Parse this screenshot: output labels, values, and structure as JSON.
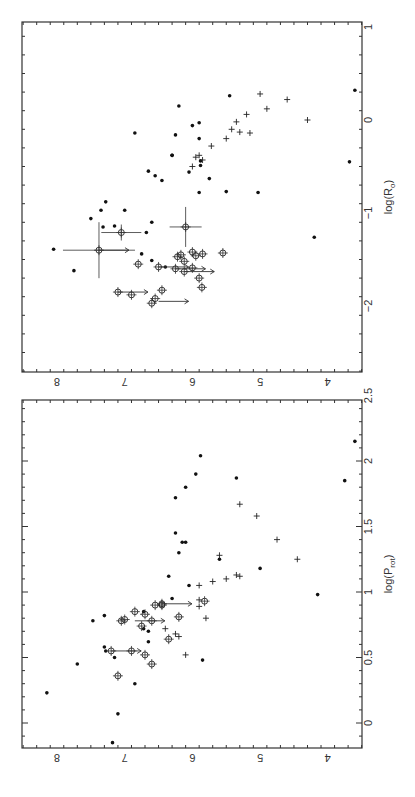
{
  "figure": {
    "rotation_note": "figure rotated 90 degrees; log(Fx) runs horizontally, decreasing left to right",
    "shared_axis_label": "log(F_x)",
    "fx_ticks": [
      "8",
      "7",
      "6",
      "5",
      "4"
    ]
  },
  "chart_data": [
    {
      "type": "scatter",
      "title": "",
      "xlabel": "log(R_o)",
      "ylabel": "log(F_x)",
      "xlim": [
        -2.7,
        1.0
      ],
      "ylim": [
        3.6,
        8.5
      ],
      "x_ticks": [
        "-2",
        "-1",
        "0",
        "1"
      ],
      "y_ticks": [
        "4",
        "5",
        "6",
        "7",
        "8"
      ],
      "grid": false,
      "series": [
        {
          "name": "filled dots",
          "marker": "dot",
          "points": [
            [
              -1.39,
              8.05
            ],
            [
              -1.62,
              7.75
            ],
            [
              -1.06,
              7.5
            ],
            [
              -0.97,
              7.35
            ],
            [
              -0.88,
              7.28
            ],
            [
              -1.14,
              7.15
            ],
            [
              -0.97,
              7.0
            ],
            [
              -1.1,
              6.6
            ],
            [
              -1.44,
              6.75
            ],
            [
              -1.58,
              6.4
            ],
            [
              -1.15,
              7.32
            ],
            [
              -1.21,
              6.68
            ],
            [
              -1.51,
              6.6
            ],
            [
              -0.65,
              6.45
            ],
            [
              -0.56,
              6.05
            ],
            [
              -0.38,
              6.3
            ],
            [
              -0.44,
              5.88
            ],
            [
              -0.14,
              6.85
            ],
            [
              -0.06,
              6.0
            ],
            [
              -0.03,
              5.9
            ],
            [
              -0.49,
              5.88
            ],
            [
              -0.78,
              5.9
            ],
            [
              0.26,
              5.45
            ],
            [
              -0.6,
              6.55
            ],
            [
              -0.63,
              5.75
            ],
            [
              -0.77,
              5.5
            ],
            [
              -0.55,
              6.65
            ],
            [
              -0.16,
              6.25
            ],
            [
              0.15,
              6.2
            ],
            [
              -0.78,
              5.03
            ],
            [
              0.32,
              3.6
            ],
            [
              -0.45,
              3.68
            ],
            [
              -1.26,
              4.2
            ],
            [
              -0.2,
              5.9
            ],
            [
              -0.38,
              6.3
            ]
          ],
          "hint": "approximate"
        },
        {
          "name": "crosses",
          "marker": "plus",
          "points": [
            [
              -0.4,
              5.95
            ],
            [
              -0.5,
              6.0
            ],
            [
              -0.43,
              5.85
            ],
            [
              -0.38,
              5.9
            ],
            [
              -0.2,
              5.5
            ],
            [
              -0.1,
              5.42
            ],
            [
              -0.02,
              5.35
            ],
            [
              -0.14,
              5.15
            ],
            [
              0.06,
              5.2
            ],
            [
              0.28,
              5.0
            ],
            [
              0.12,
              4.9
            ],
            [
              0.22,
              4.6
            ],
            [
              0.0,
              4.3
            ],
            [
              -0.28,
              5.72
            ],
            [
              -0.13,
              5.3
            ]
          ],
          "hint": "approximate"
        },
        {
          "name": "open circles with error bars",
          "marker": "circle",
          "points": [
            [
              -1.4,
              7.38
            ],
            [
              -1.21,
              7.05
            ],
            [
              -1.15,
              6.1
            ],
            [
              -1.42,
              6.0
            ],
            [
              -1.55,
              6.8
            ],
            [
              -1.58,
              6.5
            ],
            [
              -1.6,
              6.25
            ],
            [
              -1.52,
              6.12
            ],
            [
              -1.63,
              6.12
            ],
            [
              -1.85,
              7.1
            ],
            [
              -1.88,
              6.9
            ],
            [
              -1.92,
              6.55
            ],
            [
              -1.83,
              6.45
            ],
            [
              -1.45,
              6.17
            ],
            [
              -1.47,
              6.22
            ],
            [
              -1.59,
              6.0
            ],
            [
              -1.46,
              5.95
            ],
            [
              -1.43,
              5.55
            ],
            [
              -1.44,
              5.85
            ],
            [
              -1.7,
              5.9
            ],
            [
              -1.97,
              6.6
            ],
            [
              -1.8,
              5.86
            ]
          ],
          "hint": "approximate"
        }
      ],
      "annotations": [
        "horizontal arrows indicate upper limits in log(F_x)"
      ]
    },
    {
      "type": "scatter",
      "title": "",
      "xlabel": "log(P_rot)",
      "ylabel": "log(F_x)",
      "xlim": [
        -0.2,
        2.5
      ],
      "ylim": [
        3.6,
        8.5
      ],
      "x_ticks": [
        "0",
        "0.5",
        "1",
        "1.5",
        "2",
        "2.5"
      ],
      "y_ticks": [
        "4",
        "5",
        "6",
        "7",
        "8"
      ],
      "grid": false,
      "series": [
        {
          "name": "filled dots",
          "marker": "dot",
          "points": [
            [
              -0.15,
              7.18
            ],
            [
              0.07,
              7.1
            ],
            [
              0.23,
              8.15
            ],
            [
              0.3,
              6.85
            ],
            [
              0.45,
              7.7
            ],
            [
              0.5,
              7.15
            ],
            [
              0.55,
              7.28
            ],
            [
              0.58,
              7.3
            ],
            [
              0.78,
              7.47
            ],
            [
              0.82,
              7.3
            ],
            [
              0.48,
              5.85
            ],
            [
              0.72,
              6.72
            ],
            [
              0.7,
              6.65
            ],
            [
              0.85,
              6.72
            ],
            [
              0.95,
              6.3
            ],
            [
              1.05,
              6.05
            ],
            [
              1.12,
              6.35
            ],
            [
              1.3,
              6.2
            ],
            [
              1.38,
              6.15
            ],
            [
              1.38,
              6.1
            ],
            [
              1.45,
              6.25
            ],
            [
              1.72,
              6.25
            ],
            [
              1.8,
              6.1
            ],
            [
              1.9,
              5.95
            ],
            [
              2.04,
              5.88
            ],
            [
              1.87,
              5.35
            ],
            [
              1.25,
              5.6
            ],
            [
              1.18,
              5.0
            ],
            [
              0.98,
              4.15
            ],
            [
              1.85,
              3.75
            ],
            [
              2.15,
              3.6
            ],
            [
              0.62,
              6.65
            ]
          ],
          "hint": "approximate"
        },
        {
          "name": "crosses",
          "marker": "plus",
          "points": [
            [
              1.05,
              5.9
            ],
            [
              1.08,
              5.7
            ],
            [
              1.1,
              5.5
            ],
            [
              1.28,
              5.6
            ],
            [
              1.13,
              5.35
            ],
            [
              1.12,
              5.3
            ],
            [
              0.89,
              5.9
            ],
            [
              1.67,
              5.3
            ],
            [
              1.58,
              5.05
            ],
            [
              1.4,
              4.75
            ],
            [
              1.25,
              4.45
            ],
            [
              0.52,
              6.1
            ],
            [
              0.68,
              6.25
            ],
            [
              0.66,
              6.2
            ],
            [
              0.72,
              6.4
            ],
            [
              0.8,
              5.8
            ],
            [
              0.94,
              5.9
            ]
          ],
          "hint": "approximate"
        },
        {
          "name": "open circles with error bars",
          "marker": "circle",
          "points": [
            [
              0.55,
              7.2
            ],
            [
              0.36,
              7.1
            ],
            [
              0.45,
              6.6
            ],
            [
              0.52,
              6.7
            ],
            [
              0.64,
              6.35
            ],
            [
              0.55,
              6.9
            ],
            [
              0.74,
              6.75
            ],
            [
              0.79,
              7.0
            ],
            [
              0.78,
              7.05
            ],
            [
              0.83,
              6.7
            ],
            [
              0.85,
              6.85
            ],
            [
              0.9,
              6.55
            ],
            [
              0.9,
              6.45
            ],
            [
              0.91,
              6.45
            ],
            [
              0.81,
              6.2
            ],
            [
              0.93,
              5.82
            ],
            [
              0.78,
              6.6
            ]
          ],
          "hint": "approximate"
        }
      ],
      "annotations": [
        "horizontal arrows indicate upper limits in log(F_x)"
      ]
    }
  ]
}
